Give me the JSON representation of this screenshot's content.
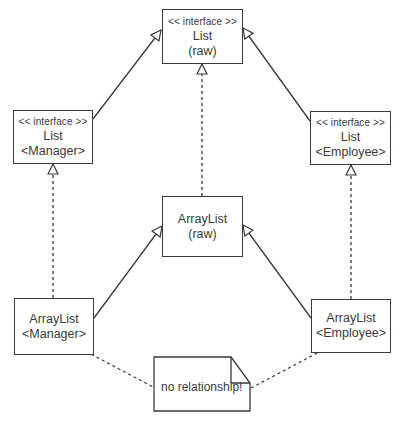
{
  "diagram": {
    "type": "uml-class-diagram",
    "nodes": {
      "list_raw": {
        "stereotype": "<< interface >>",
        "name": "List",
        "param": "(raw)"
      },
      "list_manager": {
        "stereotype": "<< interface >>",
        "name": "List",
        "param": "<Manager>"
      },
      "list_employee": {
        "stereotype": "<< interface >>",
        "name": "List",
        "param": "<Employee>"
      },
      "arraylist_raw": {
        "name": "ArrayList",
        "param": "(raw)"
      },
      "arraylist_manager": {
        "name": "ArrayList",
        "param": "<Manager>"
      },
      "arraylist_employee": {
        "name": "ArrayList",
        "param": "<Employee>"
      }
    },
    "note": {
      "text": "no relationship!"
    },
    "edges": [
      {
        "from": "list_manager",
        "to": "list_raw",
        "kind": "generalization"
      },
      {
        "from": "list_employee",
        "to": "list_raw",
        "kind": "generalization"
      },
      {
        "from": "arraylist_raw",
        "to": "list_raw",
        "kind": "realization"
      },
      {
        "from": "arraylist_manager",
        "to": "list_manager",
        "kind": "realization"
      },
      {
        "from": "arraylist_employee",
        "to": "list_employee",
        "kind": "realization"
      },
      {
        "from": "arraylist_manager",
        "to": "arraylist_raw",
        "kind": "generalization"
      },
      {
        "from": "arraylist_employee",
        "to": "arraylist_raw",
        "kind": "generalization"
      },
      {
        "from": "note",
        "to": "arraylist_manager",
        "kind": "note-link"
      },
      {
        "from": "note",
        "to": "arraylist_employee",
        "kind": "note-link"
      }
    ],
    "colors": {
      "stroke": "#3a3a3a",
      "background": "#ffffff"
    }
  }
}
